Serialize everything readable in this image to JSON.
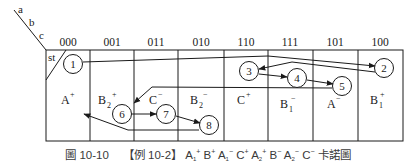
{
  "diagram": {
    "type": "karnaugh-map-sequence",
    "corner_labels": {
      "a": "a",
      "b": "b",
      "c": "c",
      "st": "st"
    },
    "columns": [
      "000",
      "001",
      "011",
      "010",
      "110",
      "111",
      "101",
      "100"
    ],
    "cells": [
      {
        "col": "000",
        "label": "A",
        "sub": "",
        "sup": "+"
      },
      {
        "col": "001",
        "label": "B",
        "sub": "2",
        "sup": "+"
      },
      {
        "col": "011",
        "label": "C",
        "sub": "",
        "sup": "−"
      },
      {
        "col": "010",
        "label": "B",
        "sub": "2",
        "sup": "−"
      },
      {
        "col": "110",
        "label": "C",
        "sub": "",
        "sup": "+"
      },
      {
        "col": "111",
        "label": "B",
        "sub": "1",
        "sup": "−"
      },
      {
        "col": "101",
        "label": "A",
        "sub": "",
        "sup": "−"
      },
      {
        "col": "100",
        "label": "B",
        "sub": "1",
        "sup": "+"
      }
    ],
    "steps": [
      {
        "n": "1",
        "cx": 73,
        "cy": 64
      },
      {
        "n": "2",
        "cx": 384,
        "cy": 68
      },
      {
        "n": "3",
        "cx": 249,
        "cy": 71
      },
      {
        "n": "4",
        "cx": 297,
        "cy": 78
      },
      {
        "n": "5",
        "cx": 342,
        "cy": 86
      },
      {
        "n": "6",
        "cx": 122,
        "cy": 114
      },
      {
        "n": "7",
        "cx": 166,
        "cy": 114
      },
      {
        "n": "8",
        "cx": 209,
        "cy": 125
      }
    ],
    "transitions": [
      "1→2",
      "2→3",
      "3→4",
      "4→5",
      "5→6",
      "6→7",
      "7→8",
      "8→A+"
    ]
  },
  "caption": {
    "figure": "圖 10-10",
    "prefix": "【例 10-2】",
    "sequence": [
      {
        "t": "A",
        "sub": "1",
        "sup": "+"
      },
      {
        "t": "B",
        "sub": "",
        "sup": "+"
      },
      {
        "t": "A",
        "sub": "1",
        "sup": "−"
      },
      {
        "t": "C",
        "sub": "",
        "sup": "+"
      },
      {
        "t": "A",
        "sub": "2",
        "sup": "+"
      },
      {
        "t": "B",
        "sub": "",
        "sup": "−"
      },
      {
        "t": "A",
        "sub": "2",
        "sup": "−"
      },
      {
        "t": "C",
        "sub": "",
        "sup": "−"
      }
    ],
    "suffix": "卡諾圖",
    "full_text": "圖 10-10 【例 10-2】A1+B+A1−C+A2+B−A2−C− 卡諾圖"
  },
  "colors": {
    "line": "#1a1a1a",
    "caption": "#3a3a3a",
    "background": "#ffffff"
  }
}
